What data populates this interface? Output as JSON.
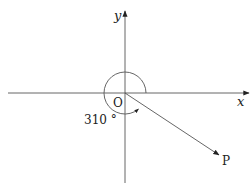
{
  "diagram": {
    "axes": {
      "x_label": "x",
      "y_label": "y",
      "origin_label": "O"
    },
    "ray": {
      "label": "P",
      "angle_deg": 310
    },
    "angle_label": "310 °",
    "colors": {
      "line": "#444444",
      "text": "#222222",
      "background": "#ffffff"
    }
  }
}
